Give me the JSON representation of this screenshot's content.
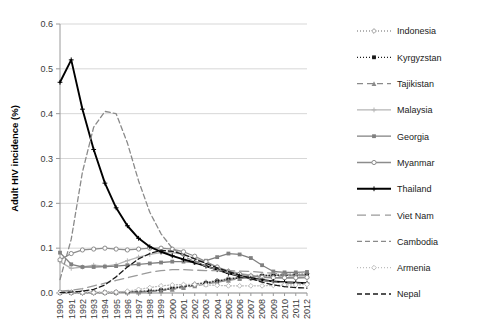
{
  "chart_data": {
    "type": "line",
    "title": "",
    "xlabel": "",
    "ylabel": "Adult HIV incidence (%)",
    "ylim": [
      0,
      0.6
    ],
    "ytick_labels": [
      "0.0",
      "0.1",
      "0.2",
      "0.3",
      "0.4",
      "0.5",
      "0.6"
    ],
    "ytick_values": [
      0,
      0.1,
      0.2,
      0.3,
      0.4,
      0.5,
      0.6
    ],
    "grid": "horizontal",
    "legend_position": "right",
    "x": [
      1990,
      1991,
      1992,
      1993,
      1994,
      1995,
      1996,
      1997,
      1998,
      1999,
      2000,
      2001,
      2002,
      2003,
      2004,
      2005,
      2006,
      2007,
      2008,
      2009,
      2010,
      2011,
      2012
    ],
    "categories": [
      "1990",
      "1991",
      "1992",
      "1993",
      "1994",
      "1995",
      "1996",
      "1997",
      "1998",
      "1999",
      "2000",
      "2001",
      "2002",
      "2003",
      "2004",
      "2005",
      "2006",
      "2007",
      "2008",
      "2009",
      "2010",
      "2011",
      "2012"
    ],
    "series": [
      {
        "name": "Indonesia",
        "color": "#9a9a9a",
        "line_style": "dotted",
        "marker": "diamond-open",
        "values": [
          0.002,
          0.002,
          0.002,
          0.002,
          0.002,
          0.003,
          0.003,
          0.004,
          0.005,
          0.008,
          0.012,
          0.016,
          0.02,
          0.024,
          0.028,
          0.032,
          0.036,
          0.038,
          0.04,
          0.041,
          0.042,
          0.042,
          0.043
        ]
      },
      {
        "name": "Kyrgyzstan",
        "color": "#1a1a1a",
        "line_style": "dotted",
        "marker": "square-filled",
        "values": [
          0.001,
          0.001,
          0.001,
          0.001,
          0.001,
          0.001,
          0.002,
          0.003,
          0.004,
          0.006,
          0.01,
          0.014,
          0.018,
          0.022,
          0.026,
          0.03,
          0.034,
          0.036,
          0.038,
          0.039,
          0.04,
          0.04,
          0.041
        ]
      },
      {
        "name": "Tajikistan",
        "color": "#8a8a8a",
        "line_style": "dash-marker",
        "marker": "triangle",
        "values": [
          0.001,
          0.001,
          0.001,
          0.001,
          0.001,
          0.001,
          0.002,
          0.002,
          0.003,
          0.005,
          0.008,
          0.012,
          0.016,
          0.02,
          0.024,
          0.028,
          0.032,
          0.034,
          0.036,
          0.037,
          0.038,
          0.038,
          0.039
        ]
      },
      {
        "name": "Malaysia",
        "color": "#b5b5b5",
        "line_style": "solid",
        "marker": "plus",
        "values": [
          0.07,
          0.055,
          0.058,
          0.062,
          0.06,
          0.063,
          0.072,
          0.08,
          0.086,
          0.09,
          0.09,
          0.086,
          0.078,
          0.068,
          0.058,
          0.05,
          0.044,
          0.04,
          0.036,
          0.034,
          0.033,
          0.033,
          0.034
        ]
      },
      {
        "name": "Georgia",
        "color": "#808080",
        "line_style": "solid",
        "marker": "square-filled",
        "values": [
          0.09,
          0.064,
          0.058,
          0.058,
          0.059,
          0.06,
          0.062,
          0.064,
          0.066,
          0.068,
          0.07,
          0.07,
          0.068,
          0.072,
          0.08,
          0.088,
          0.086,
          0.078,
          0.062,
          0.048,
          0.046,
          0.046,
          0.047
        ]
      },
      {
        "name": "Myanmar",
        "color": "#8c8c8c",
        "line_style": "solid",
        "marker": "circle-open",
        "values": [
          0.074,
          0.088,
          0.096,
          0.098,
          0.1,
          0.098,
          0.096,
          0.098,
          0.1,
          0.1,
          0.098,
          0.092,
          0.082,
          0.07,
          0.058,
          0.048,
          0.042,
          0.038,
          0.035,
          0.034,
          0.034,
          0.034,
          0.035
        ]
      },
      {
        "name": "Thailand",
        "color": "#000000",
        "line_style": "solid",
        "marker": "plus",
        "values": [
          0.47,
          0.52,
          0.41,
          0.32,
          0.245,
          0.19,
          0.15,
          0.122,
          0.103,
          0.092,
          0.083,
          0.075,
          0.068,
          0.06,
          0.052,
          0.044,
          0.038,
          0.033,
          0.029,
          0.026,
          0.024,
          0.023,
          0.022
        ]
      },
      {
        "name": "Viet Nam",
        "color": "#9a9a9a",
        "line_style": "longdash",
        "marker": "none",
        "values": [
          0.004,
          0.006,
          0.01,
          0.016,
          0.022,
          0.028,
          0.034,
          0.04,
          0.046,
          0.05,
          0.052,
          0.052,
          0.051,
          0.05,
          0.05,
          0.05,
          0.049,
          0.048,
          0.046,
          0.044,
          0.042,
          0.041,
          0.04
        ]
      },
      {
        "name": "Cambodia",
        "color": "#8a8a8a",
        "line_style": "dashed",
        "marker": "none",
        "values": [
          0.03,
          0.12,
          0.27,
          0.37,
          0.405,
          0.4,
          0.335,
          0.25,
          0.18,
          0.132,
          0.1,
          0.082,
          0.07,
          0.06,
          0.052,
          0.045,
          0.038,
          0.032,
          0.028,
          0.025,
          0.023,
          0.022,
          0.021
        ]
      },
      {
        "name": "Armenia",
        "color": "#bdbdbd",
        "line_style": "dotted",
        "marker": "diamond-open",
        "values": [
          0.001,
          0.001,
          0.001,
          0.001,
          0.001,
          0.002,
          0.004,
          0.008,
          0.012,
          0.016,
          0.018,
          0.019,
          0.019,
          0.018,
          0.017,
          0.016,
          0.016,
          0.016,
          0.016,
          0.017,
          0.018,
          0.018,
          0.019
        ]
      },
      {
        "name": "Nepal",
        "color": "#1a1a1a",
        "line_style": "dashed",
        "marker": "none",
        "values": [
          0.001,
          0.002,
          0.004,
          0.008,
          0.018,
          0.036,
          0.058,
          0.076,
          0.088,
          0.095,
          0.093,
          0.086,
          0.076,
          0.066,
          0.056,
          0.048,
          0.04,
          0.032,
          0.024,
          0.018,
          0.014,
          0.012,
          0.011
        ]
      }
    ]
  },
  "legend": {
    "items": [
      {
        "label": "Indonesia"
      },
      {
        "label": "Kyrgyzstan"
      },
      {
        "label": "Tajikistan"
      },
      {
        "label": "Malaysia"
      },
      {
        "label": "Georgia"
      },
      {
        "label": "Myanmar"
      },
      {
        "label": "Thailand"
      },
      {
        "label": "Viet Nam"
      },
      {
        "label": "Cambodia"
      },
      {
        "label": "Armenia"
      },
      {
        "label": "Nepal"
      }
    ]
  }
}
